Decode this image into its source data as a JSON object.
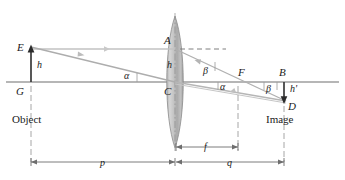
{
  "diagram": {
    "colors": {
      "axis": "#6e6e6e",
      "ray": "#b9b9b9",
      "ray_dark": "#9a9a9a",
      "dashed": "#8a8a8a",
      "lens_fill": "#c9c9c9",
      "lens_edge": "#8c8c8c",
      "text": "#1a1a1a",
      "background": "#ffffff"
    },
    "points": {
      "E": {
        "label": "E",
        "x": 31,
        "y": 47
      },
      "G": {
        "label": "G",
        "x": 31,
        "y": 82
      },
      "A": {
        "label": "A",
        "x": 175,
        "y": 49
      },
      "C": {
        "label": "C",
        "x": 175,
        "y": 82
      },
      "F": {
        "label": "F",
        "x": 240,
        "y": 82
      },
      "B": {
        "label": "B",
        "x": 284,
        "y": 82
      },
      "D": {
        "label": "D",
        "x": 284,
        "y": 101
      }
    },
    "heights": {
      "object_height": "h",
      "lens_height": "h",
      "image_height": "h'"
    },
    "angles": {
      "alpha_object": "α",
      "beta_lens": "β",
      "alpha_image": "α",
      "beta_image": "β"
    },
    "distances": {
      "object_distance": "p",
      "image_distance": "q",
      "focal_length": "f"
    },
    "captions": {
      "object": "Object",
      "image": "Image"
    }
  }
}
